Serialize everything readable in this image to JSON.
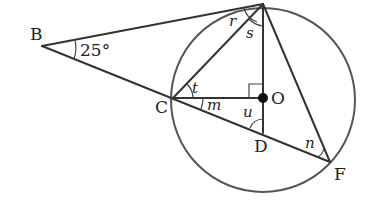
{
  "diagram": {
    "points": {
      "A": {
        "x": 263,
        "y": 4,
        "label": ""
      },
      "B": {
        "x": 42,
        "y": 46,
        "label": "B"
      },
      "C": {
        "x": 173,
        "y": 98,
        "label": "C"
      },
      "O": {
        "x": 263,
        "y": 98,
        "label": "O"
      },
      "D": {
        "x": 263,
        "y": 133,
        "label": "D"
      },
      "F": {
        "x": 330,
        "y": 162,
        "label": "F"
      }
    },
    "circle": {
      "cx": 263,
      "cy": 100,
      "r": 92
    },
    "angle_labels": {
      "B_angle": "25°",
      "r": "r",
      "s": "s",
      "t": "t",
      "m": "m",
      "u": "u",
      "n": "n"
    },
    "colors": {
      "line": "#333333",
      "circle": "#555555",
      "text": "#222222"
    }
  }
}
